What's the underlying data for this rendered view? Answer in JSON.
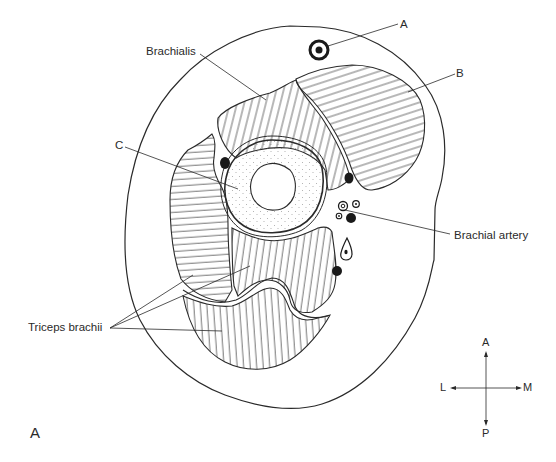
{
  "figure": {
    "panel_label": "A"
  },
  "labels": {
    "a": "A",
    "b": "B",
    "c": "C",
    "brachialis": "Brachialis",
    "brachial_artery": "Brachial artery",
    "triceps": "Triceps brachii"
  },
  "compass": {
    "anterior": "A",
    "posterior": "P",
    "lateral": "L",
    "medial": "M"
  },
  "colors": {
    "ink": "#2a2a2a",
    "background": "#ffffff"
  }
}
